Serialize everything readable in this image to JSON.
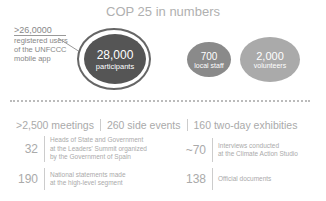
{
  "title": "COP 25 in numbers",
  "annotation": {
    "value": ">26,0000",
    "lines": [
      "registered users",
      "of the UNFCCC",
      "mobile app"
    ]
  },
  "circles": [
    {
      "number": "28,000",
      "label": "participants"
    },
    {
      "number": "700",
      "label": "local staff"
    },
    {
      "number": "2,000",
      "label": "volunteers"
    }
  ],
  "stats": [
    ">2,500 meetings",
    "260 side events",
    "160 two-day exhibities"
  ],
  "details": [
    {
      "number": "32",
      "lines": [
        "Heads of State and Government",
        "at the Leaders' Summit organized",
        "by the Government of Spain"
      ]
    },
    {
      "number": "~70",
      "lines": [
        "Interviews conducted",
        "at the Climate Action Studio"
      ]
    },
    {
      "number": "190",
      "lines": [
        "National statements made",
        "at the high-level segment"
      ]
    },
    {
      "number": "138",
      "lines": [
        "Official documents"
      ]
    }
  ]
}
